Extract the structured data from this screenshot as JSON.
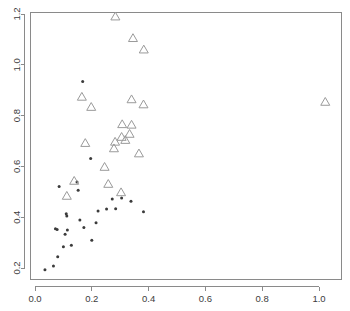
{
  "chart_data": {
    "type": "scatter",
    "title": "",
    "xlabel": "",
    "ylabel": "",
    "xlim": [
      -0.018,
      1.078
    ],
    "ylim": [
      0.155,
      1.253
    ],
    "grid": false,
    "legend": null,
    "xticks": [
      0.0,
      0.2,
      0.4,
      0.6,
      0.8,
      1.0
    ],
    "xticklabels": [
      "0.0",
      "0.2",
      "0.4",
      "0.6",
      "0.8",
      "1.0"
    ],
    "yticks": [
      0.2,
      0.4,
      0.6,
      0.8,
      1.0,
      1.2
    ],
    "yticklabels": [
      "0.2",
      "0.4",
      "0.6",
      "0.8",
      "1.0",
      "1.2"
    ],
    "series": [
      {
        "name": "filled-circles",
        "marker": "circle",
        "color": "#3b3b3b",
        "size": 3.0,
        "points": [
          [
            0.035,
            0.193
          ],
          [
            0.065,
            0.208
          ],
          [
            0.072,
            0.355
          ],
          [
            0.078,
            0.352
          ],
          [
            0.08,
            0.244
          ],
          [
            0.085,
            0.521
          ],
          [
            0.1,
            0.284
          ],
          [
            0.106,
            0.333
          ],
          [
            0.11,
            0.414
          ],
          [
            0.112,
            0.405
          ],
          [
            0.114,
            0.35
          ],
          [
            0.128,
            0.29
          ],
          [
            0.148,
            0.539
          ],
          [
            0.152,
            0.506
          ],
          [
            0.158,
            0.389
          ],
          [
            0.168,
            0.934
          ],
          [
            0.172,
            0.359
          ],
          [
            0.196,
            0.631
          ],
          [
            0.2,
            0.309
          ],
          [
            0.215,
            0.378
          ],
          [
            0.222,
            0.424
          ],
          [
            0.252,
            0.432
          ],
          [
            0.272,
            0.472
          ],
          [
            0.284,
            0.433
          ],
          [
            0.305,
            0.476
          ],
          [
            0.338,
            0.463
          ],
          [
            0.382,
            0.421
          ]
        ]
      },
      {
        "name": "open-triangles",
        "marker": "triangle-up",
        "color": "#9a9a9a",
        "size": 9.0,
        "points": [
          [
            0.283,
            1.192
          ],
          [
            0.345,
            1.107
          ],
          [
            0.383,
            1.062
          ],
          [
            0.165,
            0.876
          ],
          [
            0.198,
            0.836
          ],
          [
            0.34,
            0.866
          ],
          [
            0.382,
            0.846
          ],
          [
            1.022,
            0.856
          ],
          [
            0.307,
            0.768
          ],
          [
            0.34,
            0.766
          ],
          [
            0.305,
            0.718
          ],
          [
            0.333,
            0.73
          ],
          [
            0.318,
            0.706
          ],
          [
            0.177,
            0.694
          ],
          [
            0.282,
            0.699
          ],
          [
            0.278,
            0.673
          ],
          [
            0.366,
            0.653
          ],
          [
            0.245,
            0.6
          ],
          [
            0.138,
            0.545
          ],
          [
            0.258,
            0.533
          ],
          [
            0.112,
            0.486
          ],
          [
            0.303,
            0.5
          ]
        ]
      }
    ]
  },
  "plot": {
    "geometry": {
      "px_x0": 35.0,
      "px_x1": 319.0,
      "data_x0": 0.0,
      "data_x1": 1.0,
      "px_y0": 268.0,
      "px_y1": 14.0,
      "data_y0": 0.2,
      "data_y1": 1.2,
      "frame_left": 30.5,
      "frame_right": 341.5,
      "frame_top": 12.5,
      "frame_bottom": 279.5,
      "tick_len": 4
    },
    "style": {
      "background": "#ffffff",
      "axis_color": "#8a8a8a",
      "tick_label_color": "#3c3c3c",
      "dot_color": "#3b3b3b",
      "triangle_color": "#9a9a9a"
    }
  }
}
